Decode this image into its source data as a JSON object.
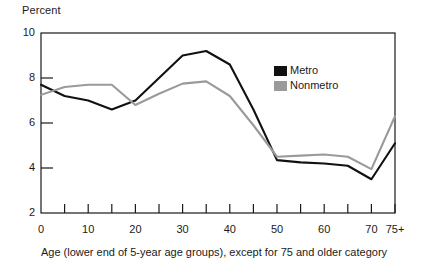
{
  "chart_data": {
    "type": "line",
    "title": "",
    "ylabel": "Percent",
    "xlabel": "Age (lower end of 5-year age groups), except for 75 and older category",
    "xlim": [
      0,
      75
    ],
    "ylim": [
      2,
      10
    ],
    "grid": false,
    "legend_position": "top-right-inside",
    "x": [
      0,
      5,
      10,
      15,
      20,
      25,
      30,
      35,
      40,
      45,
      50,
      55,
      60,
      65,
      70,
      75
    ],
    "x_tick_labels": [
      "0",
      "",
      "10",
      "",
      "20",
      "",
      "30",
      "",
      "40",
      "",
      "50",
      "",
      "60",
      "",
      "70",
      "75+"
    ],
    "x_major_labels": [
      "0",
      "10",
      "20",
      "30",
      "40",
      "50",
      "60",
      "70",
      "75+"
    ],
    "y_tick_labels": [
      "2",
      "4",
      "6",
      "8",
      "10"
    ],
    "y_ticks": [
      2,
      4,
      6,
      8,
      10
    ],
    "series": [
      {
        "name": "Metro",
        "color": "#111111",
        "values": [
          7.7,
          7.2,
          7.0,
          6.6,
          7.0,
          8.0,
          9.0,
          9.2,
          8.6,
          6.6,
          4.35,
          4.25,
          4.2,
          4.1,
          3.5,
          5.1
        ]
      },
      {
        "name": "Nonmetro",
        "color": "#9a9a9a",
        "values": [
          7.25,
          7.6,
          7.7,
          7.7,
          6.8,
          7.3,
          7.75,
          7.85,
          7.2,
          5.9,
          4.5,
          4.55,
          4.6,
          4.5,
          3.95,
          6.3
        ]
      }
    ]
  },
  "legend": {
    "items": [
      {
        "label": "Metro",
        "color": "#111111"
      },
      {
        "label": "Nonmetro",
        "color": "#9a9a9a"
      }
    ]
  },
  "axis": {
    "y_title": "Percent",
    "x_caption": "Age (lower end of 5-year age groups), except for 75 and older category"
  }
}
